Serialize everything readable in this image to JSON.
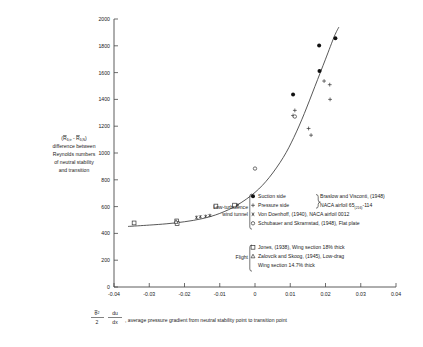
{
  "chart_data": {
    "type": "scatter",
    "title": "",
    "xlabel": "average pressure gradient from neutral stability point to transition point",
    "xlabel_formula_num": "θ̄²",
    "xlabel_formula_den": "2",
    "xlabel_formula_num2": "du",
    "xlabel_formula_den2": "dx",
    "ylabel_line1": "(R̄δ,tr - R̄δ,N)",
    "ylabel_line2": "difference between",
    "ylabel_line3": "Reynolds numbers",
    "ylabel_line4": "of neutral stability",
    "ylabel_line5": "and transition",
    "xlim": [
      -0.04,
      0.04
    ],
    "ylim": [
      0,
      2000
    ],
    "xticks": [
      -0.04,
      -0.03,
      -0.02,
      -0.01,
      0,
      0.01,
      0.02,
      0.03,
      0.04
    ],
    "xticklabels": [
      "-0.04",
      "-0.03",
      "-0.02",
      "-0.01",
      "0",
      "0.01",
      "0.02",
      "0.03",
      "0.04"
    ],
    "yticks": [
      0,
      200,
      400,
      600,
      800,
      1000,
      1200,
      1400,
      1600,
      1800,
      2000
    ],
    "yticklabels": [
      "0",
      "200",
      "400",
      "600",
      "800",
      "1000",
      "1200",
      "1400",
      "1600",
      "1800",
      "2000"
    ],
    "grid": false,
    "legend_position": "inside-right",
    "series": [
      {
        "name": "Suction side",
        "marker": "filled-circle",
        "points": [
          {
            "x": 0.0108,
            "y": 1437
          },
          {
            "x": 0.0183,
            "y": 1612
          },
          {
            "x": 0.0182,
            "y": 1803
          },
          {
            "x": 0.0228,
            "y": 1857
          }
        ]
      },
      {
        "name": "Pressure side",
        "marker": "plus",
        "points": [
          {
            "x": 0.0108,
            "y": 1280
          },
          {
            "x": 0.0113,
            "y": 1318
          },
          {
            "x": 0.0152,
            "y": 1183
          },
          {
            "x": 0.0159,
            "y": 1133
          },
          {
            "x": 0.0196,
            "y": 1537
          },
          {
            "x": 0.0212,
            "y": 1510
          },
          {
            "x": 0.0213,
            "y": 1400
          }
        ]
      },
      {
        "name": "Von Doenhoff",
        "marker": "star",
        "points": [
          {
            "x": -0.0166,
            "y": 520
          },
          {
            "x": -0.0155,
            "y": 524
          },
          {
            "x": -0.014,
            "y": 528
          },
          {
            "x": -0.0128,
            "y": 534
          },
          {
            "x": -0.0056,
            "y": 607
          },
          {
            "x": -0.0049,
            "y": 612
          }
        ]
      },
      {
        "name": "Schubauer and Skramstad",
        "marker": "open-circle",
        "points": [
          {
            "x": 0.0,
            "y": 884
          },
          {
            "x": 0.0113,
            "y": 1272
          }
        ]
      },
      {
        "name": "Jones",
        "marker": "open-square",
        "points": [
          {
            "x": -0.0343,
            "y": 478
          },
          {
            "x": -0.0222,
            "y": 493
          },
          {
            "x": -0.0221,
            "y": 474
          },
          {
            "x": -0.0111,
            "y": 604
          },
          {
            "x": -0.0058,
            "y": 611
          }
        ]
      },
      {
        "name": "Zalovcik and Skoog",
        "marker": "triangle",
        "points": [
          {
            "x": -0.0224,
            "y": 486
          }
        ]
      }
    ],
    "fit_curve": {
      "description": "monotonic rising curve through data",
      "points": [
        {
          "x": -0.036,
          "y": 452
        },
        {
          "x": -0.03,
          "y": 462
        },
        {
          "x": -0.025,
          "y": 472
        },
        {
          "x": -0.02,
          "y": 487
        },
        {
          "x": -0.015,
          "y": 510
        },
        {
          "x": -0.01,
          "y": 549
        },
        {
          "x": -0.005,
          "y": 612
        },
        {
          "x": 0.0,
          "y": 706
        },
        {
          "x": 0.004,
          "y": 816
        },
        {
          "x": 0.008,
          "y": 966
        },
        {
          "x": 0.011,
          "y": 1115
        },
        {
          "x": 0.014,
          "y": 1295
        },
        {
          "x": 0.017,
          "y": 1497
        },
        {
          "x": 0.02,
          "y": 1700
        },
        {
          "x": 0.0225,
          "y": 1870
        },
        {
          "x": 0.0238,
          "y": 1940
        }
      ]
    }
  },
  "legend": {
    "groups": [
      {
        "label_line1": "Low-turbulence",
        "label_line2": "wind tunnel",
        "entries": [
          {
            "marker": "filled-circle",
            "text": "Suction side",
            "ref": "Braslow and Visconti, (1948)"
          },
          {
            "marker": "plus",
            "text": "Pressure side",
            "ref_pre": "NACA airfoil 65",
            "ref_sub": "(216)",
            "ref_post": "-114"
          },
          {
            "marker": "star",
            "text": "Von Doenhoff, (1940), NACA airfoil 0012"
          },
          {
            "marker": "open-circle",
            "text": "Schubauer and Skramstad, (1948), Flat plate"
          }
        ]
      },
      {
        "label_line1": "Flight",
        "entries": [
          {
            "marker": "open-square",
            "text": "Jones, (1938), Wing section 18% thick"
          },
          {
            "marker": "triangle",
            "text": "Zalovcik and Skoog, (1945), Low-drag"
          },
          {
            "marker": "none",
            "text": "Wing section 14.7% thick"
          }
        ]
      }
    ]
  },
  "colors": {
    "axis": "#4a4a4a",
    "curve": "#3a3a3a",
    "text": "#1a1a1a",
    "marker_fill": "#111111",
    "background": "#ffffff"
  }
}
